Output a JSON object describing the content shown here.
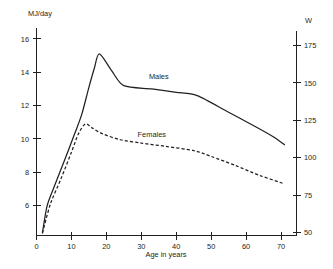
{
  "chart_data": {
    "type": "line",
    "title": "",
    "subtitle": "",
    "xlabel": "Age in years",
    "ylabel": "MJ/day",
    "ylabel_right": "W",
    "xlim": [
      0,
      72
    ],
    "ylim": [
      4.2,
      16.6
    ],
    "ylim_right": [
      48,
      186
    ],
    "grid": false,
    "legend_position": "inline-labels",
    "xticks": [
      0,
      10,
      20,
      30,
      40,
      50,
      60,
      70
    ],
    "xticklabels": [
      "0",
      "10",
      "20",
      "30",
      "40",
      "50",
      "60",
      "70"
    ],
    "yticks": [
      6,
      8,
      10,
      12,
      14,
      16
    ],
    "yticklabels": [
      "6",
      "8",
      "10",
      "12",
      "14",
      "16"
    ],
    "yticks_right": [
      50,
      75,
      100,
      125,
      150,
      175
    ],
    "yticklabels_right": [
      "50",
      "75",
      "100",
      "125",
      "150",
      "175"
    ],
    "series": [
      {
        "name": "Males",
        "style": "solid",
        "color": "#231f20",
        "label_x": 35,
        "label_y": 13.6,
        "points": [
          {
            "x": 1.7,
            "y": 4.35
          },
          {
            "x": 3.0,
            "y": 5.95
          },
          {
            "x": 5.0,
            "y": 7.1
          },
          {
            "x": 8.0,
            "y": 8.7
          },
          {
            "x": 11.0,
            "y": 10.35
          },
          {
            "x": 13.0,
            "y": 11.5
          },
          {
            "x": 15.0,
            "y": 13.1
          },
          {
            "x": 16.5,
            "y": 14.2
          },
          {
            "x": 18.0,
            "y": 15.1
          },
          {
            "x": 21.5,
            "y": 14.1
          },
          {
            "x": 25.0,
            "y": 13.2
          },
          {
            "x": 33.0,
            "y": 13.0
          },
          {
            "x": 40.0,
            "y": 12.8
          },
          {
            "x": 46.0,
            "y": 12.6
          },
          {
            "x": 55.0,
            "y": 11.6
          },
          {
            "x": 63.0,
            "y": 10.7
          },
          {
            "x": 68.0,
            "y": 10.1
          },
          {
            "x": 71.0,
            "y": 9.65
          }
        ]
      },
      {
        "name": "Females",
        "style": "dashed",
        "color": "#231f20",
        "label_x": 33,
        "label_y": 10.1,
        "points": [
          {
            "x": 1.7,
            "y": 4.35
          },
          {
            "x": 4.0,
            "y": 6.1
          },
          {
            "x": 7.0,
            "y": 7.6
          },
          {
            "x": 10.0,
            "y": 9.2
          },
          {
            "x": 12.0,
            "y": 10.3
          },
          {
            "x": 14.0,
            "y": 10.9
          },
          {
            "x": 16.0,
            "y": 10.65
          },
          {
            "x": 19.0,
            "y": 10.3
          },
          {
            "x": 24.0,
            "y": 9.95
          },
          {
            "x": 30.0,
            "y": 9.75
          },
          {
            "x": 37.0,
            "y": 9.55
          },
          {
            "x": 45.0,
            "y": 9.3
          },
          {
            "x": 50.0,
            "y": 8.95
          },
          {
            "x": 57.0,
            "y": 8.4
          },
          {
            "x": 64.0,
            "y": 7.8
          },
          {
            "x": 71.0,
            "y": 7.3
          }
        ]
      }
    ]
  }
}
